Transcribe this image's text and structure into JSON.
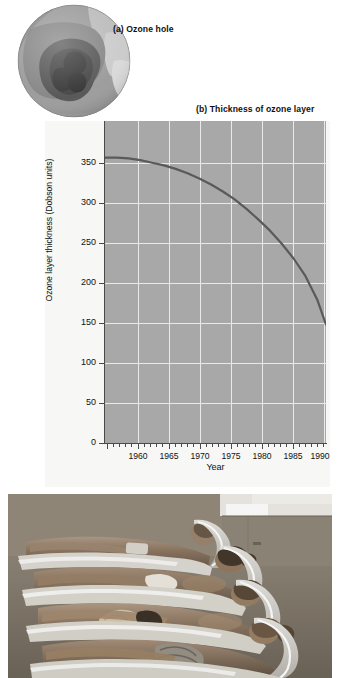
{
  "figure": {
    "panel_a_label": "(a) Ozone hole",
    "panel_b_label": "(b) Thickness of ozone layer"
  },
  "chart_data": {
    "type": "line",
    "title": "(b) Thickness of ozone layer",
    "xlabel": "Year",
    "ylabel": "Ozone layer thickness (Dobson units)",
    "annotation": "Monthly averages for October",
    "xlim": [
      1956,
      1993.5
    ],
    "ylim": [
      0,
      370
    ],
    "xticks": [
      1960,
      1965,
      1970,
      1975,
      1980,
      1985,
      1990
    ],
    "xtick_labels": [
      "1960",
      "1965",
      "1970",
      "1975",
      "1980",
      "1985",
      "1990"
    ],
    "yticks": [
      0,
      50,
      100,
      150,
      200,
      250,
      300,
      350
    ],
    "ytick_labels": [
      "0",
      "50",
      "100",
      "150",
      "200",
      "250",
      "300",
      "350"
    ],
    "grid": true,
    "grid_color": "#e9e9e9",
    "plot_bg": "#a8a8a8",
    "line_color": "#5a5a5a",
    "series": [
      {
        "name": "Ozone layer thickness (October mean)",
        "x": [
          1956,
          1958,
          1960,
          1962,
          1964,
          1966,
          1968,
          1970,
          1972,
          1974,
          1976,
          1978,
          1980,
          1982,
          1984,
          1986,
          1988,
          1990,
          1992,
          1993.5
        ],
        "values": [
          328,
          328,
          327,
          325,
          322,
          319,
          315,
          310,
          304,
          297,
          289,
          280,
          269,
          257,
          244,
          229,
          212,
          192,
          165,
          136
        ]
      }
    ]
  },
  "globe": {
    "name": "antarctic-ozone-hole-satellite-image"
  },
  "photo": {
    "name": "people-sunbathing-on-loungers-photograph"
  }
}
